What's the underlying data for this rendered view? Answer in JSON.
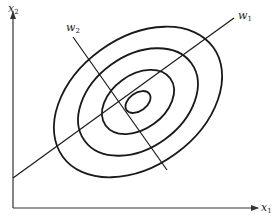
{
  "diagram": {
    "type": "principal-axes-ellipses",
    "axes": {
      "x_label": {
        "base": "x",
        "sub": "1"
      },
      "y_label": {
        "base": "x",
        "sub": "2"
      }
    },
    "directions": {
      "w1": {
        "base": "w",
        "sub": "1"
      },
      "w2": {
        "base": "w",
        "sub": "2"
      }
    },
    "ellipses": {
      "count": 4,
      "center": [
        138,
        102
      ],
      "rotation_deg": -36,
      "radii": [
        [
          14,
          9
        ],
        [
          40,
          27
        ],
        [
          66,
          46
        ],
        [
          93,
          64
        ]
      ]
    },
    "colors": {
      "stroke": "#1a1a1a",
      "axis": "#333333",
      "background": "#ffffff"
    }
  }
}
